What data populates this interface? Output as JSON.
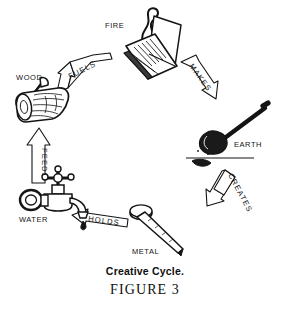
{
  "figure": {
    "title": "Creative Cycle.",
    "number_label": "FIGURE 3",
    "type": "cycle-diagram",
    "orientation": "clockwise",
    "background_color": "#ffffff",
    "ink_color": "#141414"
  },
  "nodes": [
    {
      "id": "fire",
      "label": "FIRE",
      "icon": "matchbook-flame-icon",
      "label_x": 105,
      "label_y": 21,
      "icon_cx": 150,
      "icon_cy": 48
    },
    {
      "id": "earth",
      "label": "EARTH",
      "icon": "shovel-digging-icon",
      "label_x": 234,
      "label_y": 140,
      "icon_cx": 228,
      "icon_cy": 132
    },
    {
      "id": "metal",
      "label": "METAL",
      "icon": "nail-icon",
      "label_x": 132,
      "label_y": 247,
      "icon_cx": 158,
      "icon_cy": 228
    },
    {
      "id": "water",
      "label": "WATER",
      "icon": "faucet-tap-icon",
      "label_x": 19,
      "label_y": 215,
      "icon_cx": 52,
      "icon_cy": 193
    },
    {
      "id": "wood",
      "label": "WOOD",
      "icon": "log-with-axe-icon",
      "label_x": 16,
      "label_y": 73,
      "icon_cx": 42,
      "icon_cy": 103
    }
  ],
  "arrows": [
    {
      "id": "fuels",
      "label": "FUELS",
      "from": "wood",
      "to": "fire",
      "direction": "up-right"
    },
    {
      "id": "makes",
      "label": "MAKES",
      "from": "fire",
      "to": "earth",
      "direction": "down-right"
    },
    {
      "id": "creates",
      "label": "CREATES",
      "from": "earth",
      "to": "metal",
      "direction": "down-left"
    },
    {
      "id": "holds",
      "label": "HOLDS",
      "from": "metal",
      "to": "water",
      "direction": "left"
    },
    {
      "id": "feeds",
      "label": "FEEDS",
      "from": "water",
      "to": "wood",
      "direction": "up"
    }
  ]
}
